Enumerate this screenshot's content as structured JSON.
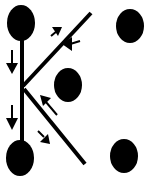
{
  "diagram": {
    "colors": {
      "ink": "#000000",
      "background": "#ffffff"
    },
    "dots": [
      {
        "id": "top-left",
        "cx": 21,
        "cy": 23,
        "rx": 14,
        "ry": 18
      },
      {
        "id": "top-right",
        "cx": 130,
        "cy": 26,
        "rx": 14,
        "ry": 17
      },
      {
        "id": "center",
        "cx": 68,
        "cy": 85,
        "rx": 14,
        "ry": 17
      },
      {
        "id": "bottom-left",
        "cx": 20,
        "cy": 158,
        "rx": 14,
        "ry": 18
      },
      {
        "id": "bottom-right",
        "cx": 124,
        "cy": 156,
        "rx": 14,
        "ry": 17
      }
    ],
    "strokes": [
      {
        "id": "vertical",
        "x1": 22,
        "y1": 23,
        "x2": 22,
        "y2": 158
      },
      {
        "id": "upper-diagonal",
        "x1": 22,
        "y1": 85,
        "x2": 91,
        "y2": 13
      },
      {
        "id": "lower-diagonal",
        "x1": 24,
        "y1": 90,
        "x2": 85,
        "y2": 164
      }
    ],
    "arrows": [
      {
        "id": "down-upper",
        "direction": "down"
      },
      {
        "id": "down-lower",
        "direction": "down"
      },
      {
        "id": "up-right",
        "direction": "up-right"
      },
      {
        "id": "left-into-diagonal",
        "direction": "left"
      },
      {
        "id": "up-left",
        "direction": "up-left"
      },
      {
        "id": "down-right",
        "direction": "down-right"
      }
    ]
  }
}
